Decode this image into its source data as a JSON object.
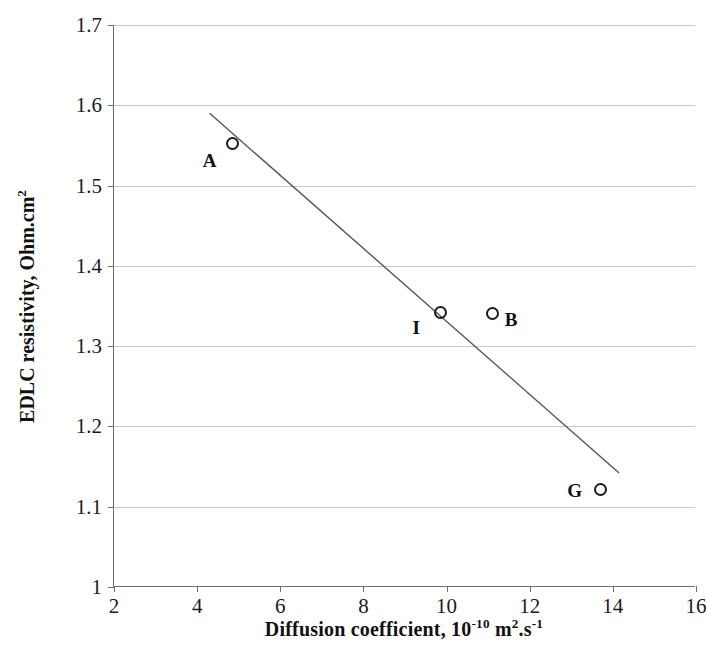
{
  "chart_data": {
    "type": "scatter",
    "title": "",
    "xlabel": "Diffusion coefficient, 10-10 m2.s-1",
    "ylabel": "EDLC resistivity, Ohm.cm2",
    "xlabel_parts": {
      "lead": "Diffusion coefficient, 10",
      "exp1": "-10",
      "mid": " m",
      "exp2": "2",
      "tail": ".s",
      "exp3": "-1"
    },
    "ylabel_parts": {
      "lead": "EDLC resistivity,  Ohm.cm",
      "exp1": "2"
    },
    "xlim": [
      2,
      16
    ],
    "ylim": [
      1.0,
      1.7
    ],
    "xticks": [
      2,
      4,
      6,
      8,
      10,
      12,
      14,
      16
    ],
    "yticks": [
      1,
      1.1,
      1.2,
      1.3,
      1.4,
      1.5,
      1.6,
      1.7
    ],
    "xtick_labels": [
      "2",
      "4",
      "6",
      "8",
      "10",
      "12",
      "14",
      "16"
    ],
    "ytick_labels": [
      "1",
      "1.1",
      "1.2",
      "1.3",
      "1.4",
      "1.5",
      "1.6",
      "1.7"
    ],
    "grid": "horizontal",
    "legend": "none",
    "marker_style": "open-circle",
    "marker_color": "#1a1a1a",
    "gridline_color": "#c9c9c9",
    "axis_color": "#6f6f6f",
    "background_color": "#ffffff",
    "points": [
      {
        "label": "A",
        "x": 4.85,
        "y": 1.552,
        "label_dx": -0.55,
        "label_dy": -0.022
      },
      {
        "label": "I",
        "x": 9.85,
        "y": 1.342,
        "label_dx": -0.58,
        "label_dy": -0.019
      },
      {
        "label": "B",
        "x": 11.1,
        "y": 1.341,
        "label_dx": 0.45,
        "label_dy": -0.009
      },
      {
        "label": "G",
        "x": 13.7,
        "y": 1.121,
        "label_dx": -0.62,
        "label_dy": -0.001
      }
    ],
    "trendline": {
      "name": "linear fit",
      "x_start": 4.3,
      "y_start": 1.59,
      "x_end": 14.15,
      "y_end": 1.142,
      "color": "#555555",
      "width": 1.4
    }
  }
}
